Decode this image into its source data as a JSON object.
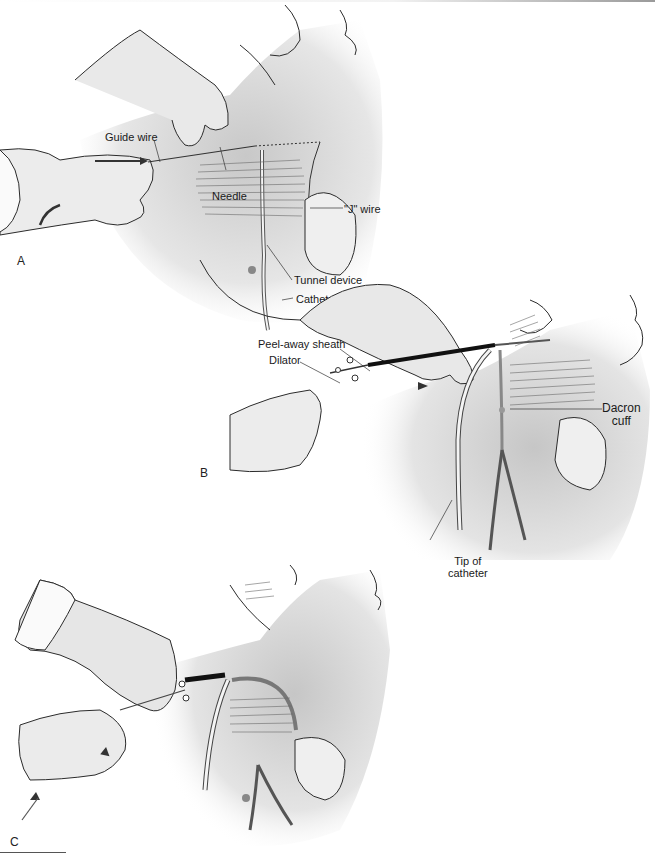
{
  "figure": {
    "panels": [
      {
        "letter": "A",
        "labels": {
          "guide_wire": "Guide wire",
          "needle": "Needle",
          "j_wire": "\"J\" wire",
          "tunnel_device": "Tunnel device",
          "catheter": "Catheter"
        }
      },
      {
        "letter": "B",
        "labels": {
          "peel_away_sheath": "Peel-away sheath",
          "dilator": "Dilator",
          "dacron_cuff_line1": "Dacron",
          "dacron_cuff_line2": "cuff",
          "tip_line1": "Tip of",
          "tip_line2": "catheter"
        }
      },
      {
        "letter": "C",
        "labels": {}
      }
    ],
    "colors": {
      "line": "#2b2b2b",
      "skin_shade": "#d9d9d9",
      "sheath": "#111111",
      "background": "#ffffff"
    }
  }
}
